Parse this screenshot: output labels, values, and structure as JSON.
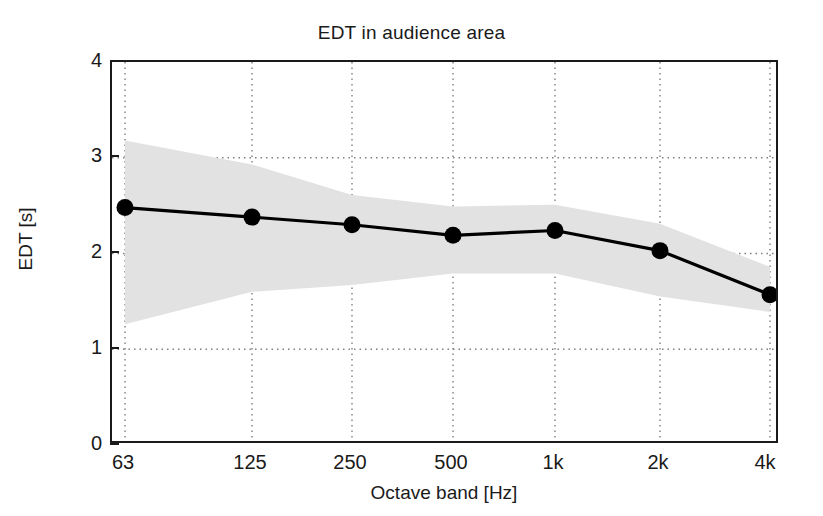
{
  "figure": {
    "title": "EDT in audience area",
    "background_color": "#ffffff",
    "line_color": "#000000",
    "band_color": "#e0e0e0",
    "grid_color": "#808080"
  },
  "axes": {
    "x_label": "Octave band [Hz]",
    "y_label": "EDT [s]",
    "x_tick_labels": [
      "63",
      "125",
      "250",
      "500",
      "1k",
      "2k",
      "4k"
    ],
    "y_tick_labels": [
      "0",
      "1",
      "2",
      "3",
      "4"
    ]
  },
  "chart_data": {
    "type": "line",
    "title": "EDT in audience area",
    "xlabel": "Octave band [Hz]",
    "ylabel": "EDT [s]",
    "categories": [
      "63",
      "125",
      "250",
      "500",
      "1k",
      "2k",
      "4k"
    ],
    "x_values": [
      63,
      125,
      250,
      500,
      1000,
      2000,
      4000
    ],
    "values": [
      2.48,
      2.38,
      2.3,
      2.19,
      2.24,
      2.03,
      1.57
    ],
    "band_upper": [
      3.18,
      2.93,
      2.61,
      2.49,
      2.51,
      2.31,
      1.86
    ],
    "band_lower": [
      1.26,
      1.6,
      1.67,
      1.79,
      1.79,
      1.55,
      1.39
    ],
    "series": [
      {
        "name": "EDT mean",
        "values": [
          2.48,
          2.38,
          2.3,
          2.19,
          2.24,
          2.03,
          1.57
        ],
        "marker": "filled-circle",
        "color": "#000000"
      },
      {
        "name": "EDT spread band",
        "upper": [
          3.18,
          2.93,
          2.61,
          2.49,
          2.51,
          2.31,
          1.86
        ],
        "lower": [
          1.26,
          1.6,
          1.67,
          1.79,
          1.79,
          1.55,
          1.39
        ],
        "color": "#e0e0e0"
      }
    ],
    "ylim": [
      0,
      4
    ],
    "ytick_values": [
      0,
      1,
      2,
      3,
      4
    ],
    "grid": true,
    "grid_style": "dotted",
    "legend": false
  }
}
